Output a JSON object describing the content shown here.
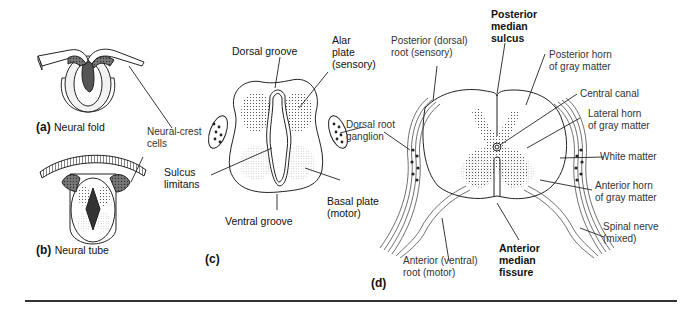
{
  "panels": {
    "a": {
      "letter": "(a)",
      "caption": "Neural fold"
    },
    "b": {
      "letter": "(b)",
      "caption": "Neural tube"
    },
    "c": {
      "letter": "(c)"
    },
    "d": {
      "letter": "(d)"
    }
  },
  "labels": {
    "neural_crest": "Neural-crest\ncells",
    "dorsal_groove": "Dorsal groove",
    "alar_plate": "Alar\nplate\n(sensory)",
    "dorsal_root_ganglion": "Dorsal root\nganglion",
    "sulcus_limitans": "Sulcus\nlimitans",
    "basal_plate": "Basal plate\n(motor)",
    "ventral_groove": "Ventral groove",
    "posterior_root": "Posterior (dorsal)\nroot (sensory)",
    "posterior_median_sulcus": "Posterior\nmedian\nsulcus",
    "posterior_horn": "Posterior horn\nof gray matter",
    "central_canal": "Central canal",
    "lateral_horn": "Lateral horn\nof gray matter",
    "white_matter": "White matter",
    "anterior_horn": "Anterior horn\nof gray matter",
    "spinal_nerve": "Spinal nerve\n(mixed)",
    "anterior_root": "Anterior (ventral)\nroot (motor)",
    "anterior_median_fissure": "Anterior\nmedian\nfissure"
  },
  "colors": {
    "ink": "#222222",
    "label": "#333333",
    "stipple": "#9a9a9a",
    "background": "#ffffff"
  }
}
